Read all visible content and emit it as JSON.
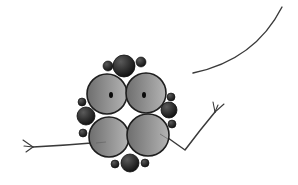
{
  "illustration": {
    "subject": "molecule character",
    "colors": {
      "background": "#ffffff",
      "large_sphere_dark": "#6e6e6e",
      "large_sphere_light": "#b4b4b4",
      "large_sphere_outline": "#1e1e1e",
      "small_sphere_dark": "#0f0f0f",
      "small_sphere_light": "#5a5a5a",
      "eye": "#0a0a0a",
      "line": "#3a3a3a"
    },
    "large_spheres": [
      {
        "name": "upper-left",
        "cx": 107,
        "cy": 94,
        "r": 20
      },
      {
        "name": "upper-right",
        "cx": 146,
        "cy": 93,
        "r": 20
      },
      {
        "name": "lower-left",
        "cx": 109,
        "cy": 137,
        "r": 20
      },
      {
        "name": "lower-right",
        "cx": 148,
        "cy": 135,
        "r": 21
      }
    ],
    "eyes": [
      {
        "cx": 111,
        "cy": 95,
        "rx": 2,
        "ry": 3
      },
      {
        "cx": 144,
        "cy": 95,
        "rx": 2,
        "ry": 3
      }
    ],
    "dark_spheres": [
      {
        "name": "top",
        "cx": 124,
        "cy": 66,
        "r": 11
      },
      {
        "name": "left",
        "cx": 86,
        "cy": 116,
        "r": 9
      },
      {
        "name": "right",
        "cx": 169,
        "cy": 110,
        "r": 8
      },
      {
        "name": "bottom",
        "cx": 130,
        "cy": 163,
        "r": 9
      }
    ],
    "small_spheres": [
      {
        "cx": 108,
        "cy": 66,
        "r": 5
      },
      {
        "cx": 141,
        "cy": 62,
        "r": 5
      },
      {
        "cx": 82,
        "cy": 102,
        "r": 4
      },
      {
        "cx": 83,
        "cy": 133,
        "r": 4
      },
      {
        "cx": 171,
        "cy": 97,
        "r": 4
      },
      {
        "cx": 172,
        "cy": 124,
        "r": 4
      },
      {
        "cx": 115,
        "cy": 164,
        "r": 4
      },
      {
        "cx": 145,
        "cy": 163,
        "r": 4
      }
    ],
    "left_arm": {
      "path": "M 104 142 Q 70 145 33 147",
      "fingers": [
        "M 33 147 L 23 140",
        "M 33 147 L 24 146",
        "M 33 147 L 26 152"
      ]
    },
    "right_arm": {
      "path": "M 161 133 L 185 150 Q 200 130 215 112",
      "fingers": [
        "M 215 112 L 213 102",
        "M 215 112 L 218 105",
        "M 215 112 L 224 104"
      ]
    },
    "curve": {
      "path": "M 193 73 Q 255 60 282 7"
    }
  }
}
